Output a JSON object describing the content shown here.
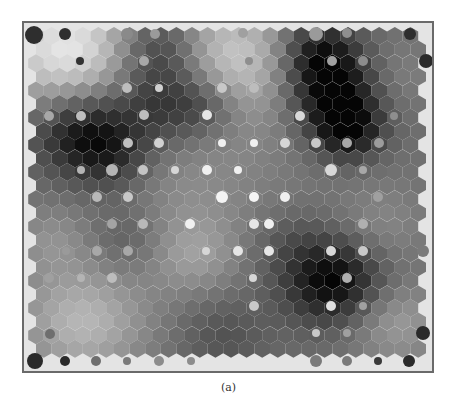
{
  "figure": {
    "caption": "(a)",
    "type": "SOM U-matrix (hexagonal grid) with hit markers",
    "colors": {
      "frame": "#6a6a6a",
      "background": "#e4e4e4",
      "darkest": "#050505",
      "lightest": "#f0f0f0",
      "marker_light": "#f2f2f2",
      "marker_dark": "#2a2a2a"
    },
    "grid": {
      "columns": 25,
      "rows": 24,
      "origin_x": 12,
      "origin_y": 13,
      "dx": 15.6,
      "dy": 13.6,
      "hex_radius": 9.0,
      "base_gray": 112
    },
    "field": [
      {
        "cx": 2,
        "cy": 1,
        "r": 4.5,
        "v": 120
      },
      {
        "cx": 12,
        "cy": 2,
        "r": 5.0,
        "v": 100
      },
      {
        "cx": 8,
        "cy": 1,
        "r": 3.0,
        "v": -90
      },
      {
        "cx": 8,
        "cy": 5,
        "r": 3.0,
        "v": -70
      },
      {
        "cx": 11,
        "cy": 5,
        "r": 2.5,
        "v": -60
      },
      {
        "cx": 3,
        "cy": 7,
        "r": 3.2,
        "v": -100
      },
      {
        "cx": 5,
        "cy": 9,
        "r": 2.5,
        "v": -40
      },
      {
        "cx": 18,
        "cy": 1,
        "r": 2.5,
        "v": -80
      },
      {
        "cx": 19,
        "cy": 4,
        "r": 3.0,
        "v": -110
      },
      {
        "cx": 20,
        "cy": 7,
        "r": 2.2,
        "v": -90
      },
      {
        "cx": 23,
        "cy": 3,
        "r": 2.5,
        "v": 20
      },
      {
        "cx": 19,
        "cy": 18,
        "r": 3.2,
        "v": -110
      },
      {
        "cx": 10,
        "cy": 16,
        "r": 3.0,
        "v": 45
      },
      {
        "cx": 9,
        "cy": 11,
        "r": 4.0,
        "v": 20
      },
      {
        "cx": 14,
        "cy": 12,
        "r": 4.0,
        "v": 10
      },
      {
        "cx": 3,
        "cy": 21,
        "r": 4.0,
        "v": 70
      },
      {
        "cx": 1,
        "cy": 15,
        "r": 2.5,
        "v": 30
      },
      {
        "cx": 12,
        "cy": 22,
        "r": 3.0,
        "v": -30
      },
      {
        "cx": 22,
        "cy": 14,
        "r": 3.0,
        "v": 25
      },
      {
        "cx": 23,
        "cy": 21,
        "r": 3.0,
        "v": 45
      },
      {
        "cx": 16,
        "cy": 15,
        "r": 2.5,
        "v": -20
      },
      {
        "cx": 6,
        "cy": 15,
        "r": 2.5,
        "v": -25
      }
    ],
    "markers": [
      {
        "x": 34,
        "y": 35,
        "r": 9,
        "shade": "#2e2e2e"
      },
      {
        "x": 65,
        "y": 34,
        "r": 6,
        "shade": "#2e2e2e"
      },
      {
        "x": 127,
        "y": 34,
        "r": 6,
        "shade": "#8a8a8a"
      },
      {
        "x": 155,
        "y": 34,
        "r": 5,
        "shade": "#9a9a9a"
      },
      {
        "x": 243,
        "y": 33,
        "r": 5,
        "shade": "#a0a0a0"
      },
      {
        "x": 316,
        "y": 34,
        "r": 7,
        "shade": "#9a9a9a"
      },
      {
        "x": 347,
        "y": 33,
        "r": 5,
        "shade": "#8e8e8e"
      },
      {
        "x": 410,
        "y": 34,
        "r": 6,
        "shade": "#2e2e2e"
      },
      {
        "x": 80,
        "y": 61,
        "r": 4,
        "shade": "#333333"
      },
      {
        "x": 144,
        "y": 61,
        "r": 5,
        "shade": "#a8a8a8"
      },
      {
        "x": 249,
        "y": 61,
        "r": 4,
        "shade": "#8e8e8e"
      },
      {
        "x": 332,
        "y": 61,
        "r": 5,
        "shade": "#a0a0a0"
      },
      {
        "x": 363,
        "y": 61,
        "r": 5,
        "shade": "#8c8c8c"
      },
      {
        "x": 426,
        "y": 61,
        "r": 7,
        "shade": "#2a2a2a"
      },
      {
        "x": 127,
        "y": 88,
        "r": 5,
        "shade": "#bdbdbd"
      },
      {
        "x": 159,
        "y": 88,
        "r": 4,
        "shade": "#d0d0d0"
      },
      {
        "x": 222,
        "y": 88,
        "r": 5,
        "shade": "#c8c8c8"
      },
      {
        "x": 254,
        "y": 88,
        "r": 5,
        "shade": "#bdbdbd"
      },
      {
        "x": 49,
        "y": 116,
        "r": 5,
        "shade": "#a8a8a8"
      },
      {
        "x": 81,
        "y": 116,
        "r": 5,
        "shade": "#bdbdbd"
      },
      {
        "x": 144,
        "y": 115,
        "r": 5,
        "shade": "#bdbdbd"
      },
      {
        "x": 207,
        "y": 115,
        "r": 5,
        "shade": "#e6e6e6"
      },
      {
        "x": 300,
        "y": 116,
        "r": 5,
        "shade": "#d8d8d8"
      },
      {
        "x": 394,
        "y": 116,
        "r": 4,
        "shade": "#8e8e8e"
      },
      {
        "x": 128,
        "y": 143,
        "r": 5,
        "shade": "#c0c0c0"
      },
      {
        "x": 159,
        "y": 143,
        "r": 5,
        "shade": "#d2d2d2"
      },
      {
        "x": 222,
        "y": 143,
        "r": 4,
        "shade": "#f0f0f0"
      },
      {
        "x": 254,
        "y": 143,
        "r": 4,
        "shade": "#f0f0f0"
      },
      {
        "x": 285,
        "y": 143,
        "r": 5,
        "shade": "#d6d6d6"
      },
      {
        "x": 316,
        "y": 143,
        "r": 5,
        "shade": "#c8c8c8"
      },
      {
        "x": 347,
        "y": 143,
        "r": 5,
        "shade": "#a8a8a8"
      },
      {
        "x": 379,
        "y": 143,
        "r": 5,
        "shade": "#9c9c9c"
      },
      {
        "x": 81,
        "y": 170,
        "r": 4,
        "shade": "#b4b4b4"
      },
      {
        "x": 112,
        "y": 170,
        "r": 6,
        "shade": "#b4b4b4"
      },
      {
        "x": 143,
        "y": 170,
        "r": 5,
        "shade": "#c4c4c4"
      },
      {
        "x": 175,
        "y": 170,
        "r": 4,
        "shade": "#d6d6d6"
      },
      {
        "x": 207,
        "y": 170,
        "r": 5,
        "shade": "#f0f0f0"
      },
      {
        "x": 238,
        "y": 170,
        "r": 4,
        "shade": "#f0f0f0"
      },
      {
        "x": 331,
        "y": 170,
        "r": 6,
        "shade": "#d8d8d8"
      },
      {
        "x": 363,
        "y": 170,
        "r": 4,
        "shade": "#a8a8a8"
      },
      {
        "x": 97,
        "y": 197,
        "r": 5,
        "shade": "#b8b8b8"
      },
      {
        "x": 128,
        "y": 197,
        "r": 5,
        "shade": "#c8c8c8"
      },
      {
        "x": 222,
        "y": 197,
        "r": 6,
        "shade": "#f4f4f4"
      },
      {
        "x": 254,
        "y": 197,
        "r": 5,
        "shade": "#f4f4f4"
      },
      {
        "x": 285,
        "y": 197,
        "r": 5,
        "shade": "#f0f0f0"
      },
      {
        "x": 378,
        "y": 197,
        "r": 5,
        "shade": "#a0a0a0"
      },
      {
        "x": 112,
        "y": 224,
        "r": 5,
        "shade": "#a4a4a4"
      },
      {
        "x": 143,
        "y": 224,
        "r": 5,
        "shade": "#b8b8b8"
      },
      {
        "x": 190,
        "y": 224,
        "r": 5,
        "shade": "#f0f0f0"
      },
      {
        "x": 254,
        "y": 224,
        "r": 5,
        "shade": "#e6e6e6"
      },
      {
        "x": 269,
        "y": 224,
        "r": 5,
        "shade": "#f0f0f0"
      },
      {
        "x": 363,
        "y": 224,
        "r": 5,
        "shade": "#b0b0b0"
      },
      {
        "x": 66,
        "y": 251,
        "r": 4,
        "shade": "#9a9a9a"
      },
      {
        "x": 97,
        "y": 251,
        "r": 5,
        "shade": "#a8a8a8"
      },
      {
        "x": 128,
        "y": 251,
        "r": 5,
        "shade": "#a8a8a8"
      },
      {
        "x": 206,
        "y": 251,
        "r": 4,
        "shade": "#d6d6d6"
      },
      {
        "x": 238,
        "y": 251,
        "r": 5,
        "shade": "#e6e6e6"
      },
      {
        "x": 269,
        "y": 251,
        "r": 5,
        "shade": "#e6e6e6"
      },
      {
        "x": 331,
        "y": 251,
        "r": 5,
        "shade": "#d8d8d8"
      },
      {
        "x": 363,
        "y": 251,
        "r": 5,
        "shade": "#c8c8c8"
      },
      {
        "x": 423,
        "y": 251,
        "r": 6,
        "shade": "#7a7a7a"
      },
      {
        "x": 49,
        "y": 278,
        "r": 5,
        "shade": "#a0a0a0"
      },
      {
        "x": 81,
        "y": 278,
        "r": 4,
        "shade": "#b4b4b4"
      },
      {
        "x": 112,
        "y": 278,
        "r": 5,
        "shade": "#bdbdbd"
      },
      {
        "x": 253,
        "y": 278,
        "r": 4,
        "shade": "#d6d6d6"
      },
      {
        "x": 347,
        "y": 278,
        "r": 5,
        "shade": "#b0b0b0"
      },
      {
        "x": 254,
        "y": 306,
        "r": 5,
        "shade": "#c8c8c8"
      },
      {
        "x": 331,
        "y": 306,
        "r": 5,
        "shade": "#e0e0e0"
      },
      {
        "x": 363,
        "y": 306,
        "r": 4,
        "shade": "#a0a0a0"
      },
      {
        "x": 50,
        "y": 334,
        "r": 5,
        "shade": "#6e6e6e"
      },
      {
        "x": 316,
        "y": 333,
        "r": 4,
        "shade": "#c8c8c8"
      },
      {
        "x": 347,
        "y": 333,
        "r": 4,
        "shade": "#a0a0a0"
      },
      {
        "x": 423,
        "y": 333,
        "r": 7,
        "shade": "#2a2a2a"
      },
      {
        "x": 35,
        "y": 361,
        "r": 8,
        "shade": "#2a2a2a"
      },
      {
        "x": 65,
        "y": 361,
        "r": 5,
        "shade": "#2a2a2a"
      },
      {
        "x": 96,
        "y": 361,
        "r": 5,
        "shade": "#6e6e6e"
      },
      {
        "x": 127,
        "y": 361,
        "r": 4,
        "shade": "#7a7a7a"
      },
      {
        "x": 159,
        "y": 361,
        "r": 5,
        "shade": "#8c8c8c"
      },
      {
        "x": 191,
        "y": 361,
        "r": 4,
        "shade": "#8c8c8c"
      },
      {
        "x": 316,
        "y": 361,
        "r": 6,
        "shade": "#7a7a7a"
      },
      {
        "x": 347,
        "y": 361,
        "r": 5,
        "shade": "#7a7a7a"
      },
      {
        "x": 378,
        "y": 361,
        "r": 4,
        "shade": "#3a3a3a"
      },
      {
        "x": 409,
        "y": 361,
        "r": 6,
        "shade": "#2a2a2a"
      }
    ]
  }
}
